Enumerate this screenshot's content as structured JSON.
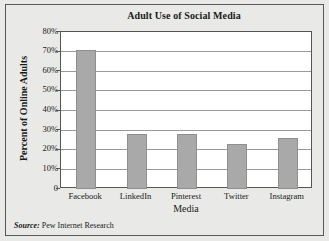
{
  "figure": {
    "source_prefix": "Source:",
    "source_text": "Pew Internet Research",
    "background_color": "#e9e9e7",
    "border_color": "#595959",
    "plot_background": "#ffffff",
    "bar_color": "#a9a9a9",
    "grid_color": "#9a9a9a"
  },
  "chart_data": {
    "type": "bar",
    "title": "Adult Use of Social Media",
    "xlabel": "Media",
    "ylabel": "Percent of Online Adults",
    "categories": [
      "Facebook",
      "LinkedIn",
      "Pinterest",
      "Twitter",
      "Instagram"
    ],
    "values": [
      71,
      28,
      28,
      23,
      26
    ],
    "ylim": [
      0,
      80
    ],
    "ytick_values": [
      0,
      10,
      20,
      30,
      40,
      50,
      60,
      70,
      80
    ],
    "ytick_labels": [
      "0",
      "10%",
      "20%",
      "30%",
      "40%",
      "50%",
      "60%",
      "70%",
      "80%"
    ],
    "grid": "horizontal",
    "legend": "none",
    "series": [
      {
        "name": "Percent of Online Adults",
        "values": [
          71,
          28,
          28,
          23,
          26
        ]
      }
    ]
  }
}
